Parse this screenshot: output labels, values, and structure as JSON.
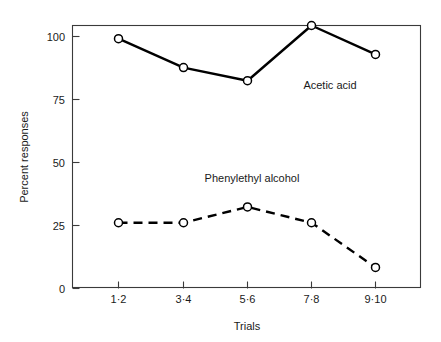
{
  "chart_data": {
    "type": "line",
    "title": "",
    "xlabel": "Trials",
    "ylabel": "Percent responses",
    "categories": [
      "1·2",
      "3·4",
      "5·6",
      "7·8",
      "9·10"
    ],
    "ylim": [
      0,
      100
    ],
    "yticks": [
      0,
      25,
      50,
      75,
      100
    ],
    "yticklabels": [
      "0",
      "25",
      "50",
      "75",
      "100"
    ],
    "grid": false,
    "legend_position": "inline-annotation",
    "series": [
      {
        "name": "Acetic acid",
        "values": [
          95,
          84,
          79,
          100,
          89
        ],
        "linestyle": "solid",
        "marker": "open-circle",
        "color": "#000000",
        "label_x_category_index": 3,
        "label_value": 88
      },
      {
        "name": "Phenylethyl alcohol",
        "values": [
          25,
          25,
          31,
          25,
          8
        ],
        "linestyle": "dashed",
        "marker": "open-circle",
        "color": "#000000",
        "label_x_category_index": 2,
        "label_value": 43
      }
    ],
    "annotations": [
      {
        "text": "Acetic acid",
        "x": 330,
        "y": 89
      },
      {
        "text": "Phenylethyl alcohol",
        "x": 252,
        "y": 182
      }
    ]
  },
  "axes": {
    "y_title": "Percent responses",
    "x_title": "Trials",
    "y_tick_labels": [
      "100",
      "75",
      "50",
      "25",
      "0"
    ],
    "x_tick_labels": [
      "1·2",
      "3·4",
      "5·6",
      "7·8",
      "9·10"
    ]
  },
  "colors": {
    "line": "#000000",
    "frame": "#3a3a3a",
    "marker_fill": "#ffffff",
    "background": "#ffffff",
    "text": "#1a1a1a"
  }
}
